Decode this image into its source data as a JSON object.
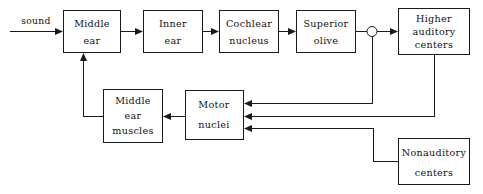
{
  "diagram": {
    "type": "block-flow-diagram",
    "canvas": {
      "width": 483,
      "height": 194,
      "background": "#ffffff"
    },
    "line_color": "#1a1a1a",
    "text_color": "#111111",
    "input_label": "sound",
    "blocks": [
      {
        "id": "middle-ear",
        "lines": [
          "Middle",
          "ear"
        ],
        "line1": "Middle",
        "line2": "ear",
        "line3": "",
        "x": 63,
        "y": 10,
        "w": 58,
        "h": 43
      },
      {
        "id": "inner-ear",
        "lines": [
          "Inner",
          "ear"
        ],
        "line1": "Inner",
        "line2": "ear",
        "line3": "",
        "x": 143,
        "y": 10,
        "w": 60,
        "h": 43
      },
      {
        "id": "cochlear-nucleus",
        "lines": [
          "Cochlear",
          "nucleus"
        ],
        "line1": "Cochlear",
        "line2": "nucleus",
        "line3": "",
        "x": 219,
        "y": 10,
        "w": 60,
        "h": 43
      },
      {
        "id": "superior-olive",
        "lines": [
          "Superior",
          "olive"
        ],
        "line1": "Superior",
        "line2": "olive",
        "line3": "",
        "x": 296,
        "y": 10,
        "w": 60,
        "h": 43
      },
      {
        "id": "higher-auditory-centers",
        "lines": [
          "Higher",
          "auditory",
          "centers"
        ],
        "line1": "Higher",
        "line2": "auditory",
        "line3": "centers",
        "x": 398,
        "y": 8,
        "w": 72,
        "h": 47
      },
      {
        "id": "middle-ear-muscles",
        "lines": [
          "Middle",
          "ear",
          "muscles"
        ],
        "line1": "Middle",
        "line2": "ear",
        "line3": "muscles",
        "x": 103,
        "y": 89,
        "w": 60,
        "h": 54
      },
      {
        "id": "motor-nuclei",
        "lines": [
          "Motor",
          "nuclei"
        ],
        "line1": "Motor",
        "line2": "nuclei",
        "line3": "",
        "x": 185,
        "y": 90,
        "w": 59,
        "h": 50
      },
      {
        "id": "nonauditory-centers",
        "lines": [
          "Nonauditory",
          "centers"
        ],
        "line1": "Nonauditory",
        "line2": "centers",
        "line3": "",
        "x": 398,
        "y": 138,
        "w": 72,
        "h": 47
      }
    ],
    "junction": {
      "id": "olive-branch-node",
      "cx": 372,
      "cy": 31,
      "r": 5
    },
    "connections": [
      {
        "id": "sound-to-middle-ear",
        "from": "sound",
        "to": "middle-ear"
      },
      {
        "id": "middle-ear-to-inner-ear",
        "from": "middle-ear",
        "to": "inner-ear"
      },
      {
        "id": "inner-ear-to-cochlear-nucleus",
        "from": "inner-ear",
        "to": "cochlear-nucleus"
      },
      {
        "id": "cochlear-nucleus-to-superior-olive",
        "from": "cochlear-nucleus",
        "to": "superior-olive"
      },
      {
        "id": "superior-olive-to-junction",
        "from": "superior-olive",
        "to": "olive-branch-node"
      },
      {
        "id": "junction-to-higher-auditory-centers",
        "from": "olive-branch-node",
        "to": "higher-auditory-centers"
      },
      {
        "id": "junction-to-motor-nuclei",
        "from": "olive-branch-node",
        "to": "motor-nuclei"
      },
      {
        "id": "higher-auditory-centers-to-motor-nuclei",
        "from": "higher-auditory-centers",
        "to": "motor-nuclei"
      },
      {
        "id": "nonauditory-centers-to-motor-nuclei",
        "from": "nonauditory-centers",
        "to": "motor-nuclei"
      },
      {
        "id": "motor-nuclei-to-middle-ear-muscles",
        "from": "motor-nuclei",
        "to": "middle-ear-muscles"
      },
      {
        "id": "middle-ear-muscles-to-middle-ear",
        "from": "middle-ear-muscles",
        "to": "middle-ear"
      }
    ]
  }
}
